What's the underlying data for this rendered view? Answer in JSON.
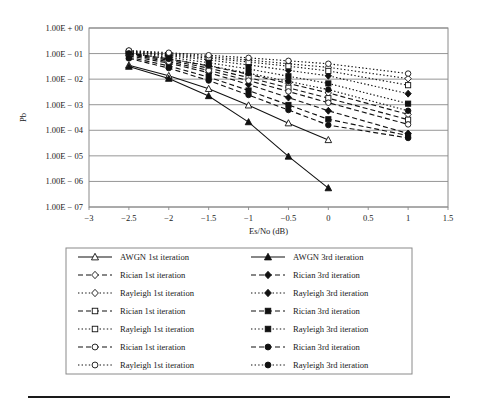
{
  "figure": {
    "background": "#ffffff",
    "ink_color": "#111111",
    "grid_color": "#8a8a8a",
    "has_bottom_rule": true
  },
  "chart_data": {
    "type": "line",
    "title": "",
    "xlabel": "Es/No (dB)",
    "ylabel": "Pb",
    "xlim": [
      -3,
      1.5
    ],
    "ylim": [
      1e-07,
      1
    ],
    "yscale": "log",
    "grid": true,
    "legend_position": "below-plot",
    "xticks": [
      -3,
      -2.5,
      -2,
      -1.5,
      -1,
      -0.5,
      0,
      0.5,
      1,
      1.5
    ],
    "xticklabels": [
      "−3",
      "−2.5",
      "−2",
      "−1.5",
      "−1",
      "−0.5",
      "0",
      "0.5",
      "1",
      "1.5"
    ],
    "yticks": [
      1,
      0.1,
      0.01,
      0.001,
      0.0001,
      1e-05,
      1e-06,
      1e-07
    ],
    "yticklabels": [
      "1.00E + 00",
      "1.00E − 01",
      "1.00E − 02",
      "1.00E − 03",
      "1.00E − 04",
      "1.00E − 05",
      "1.00E − 06",
      "1.00E − 07"
    ],
    "series": [
      {
        "name": "AWGN 1st iteration",
        "channel": "AWGN",
        "iteration": "1st",
        "dash": "solid",
        "marker": "triangle",
        "filled": false,
        "x": [
          -2.5,
          -2,
          -1.5,
          -1,
          -0.5,
          0
        ],
        "values": [
          0.035,
          0.0135,
          0.0042,
          0.00095,
          0.00019,
          4.2e-05
        ]
      },
      {
        "name": "AWGN 3rd iteration",
        "channel": "AWGN",
        "iteration": "3rd",
        "dash": "solid",
        "marker": "triangle",
        "filled": true,
        "x": [
          -2.5,
          -2,
          -1.5,
          -1,
          -0.5,
          0
        ],
        "values": [
          0.031,
          0.0105,
          0.0022,
          0.00021,
          9.5e-06,
          5.5e-07
        ]
      },
      {
        "name": "Rician 1st iteration",
        "channel": "Rician",
        "iteration": "1st",
        "dash": "dashed",
        "marker": "diamond",
        "filled": false,
        "x": [
          -2.5,
          -2,
          -1.5,
          -1,
          -0.5,
          0,
          1
        ],
        "values": [
          0.105,
          0.062,
          0.033,
          0.0155,
          0.0068,
          0.0029,
          0.00042
        ]
      },
      {
        "name": "Rician 3rd iteration",
        "channel": "Rician",
        "iteration": "3rd",
        "dash": "dashed",
        "marker": "diamond",
        "filled": true,
        "x": [
          -2.5,
          -2,
          -1.5,
          -1,
          -0.5,
          0,
          1
        ],
        "values": [
          0.082,
          0.042,
          0.018,
          0.0062,
          0.0019,
          0.00058,
          7.5e-05
        ]
      },
      {
        "name": "Rayleigh 1st iteration",
        "channel": "Rayleigh",
        "iteration": "1st",
        "dash": "dotted",
        "marker": "diamond",
        "filled": false,
        "x": [
          -2.5,
          -2,
          -1.5,
          -1,
          -0.5,
          0,
          1
        ],
        "values": [
          0.125,
          0.098,
          0.075,
          0.056,
          0.04,
          0.029,
          0.0105
        ]
      },
      {
        "name": "Rayleigh 3rd iteration",
        "channel": "Rayleigh",
        "iteration": "3rd",
        "dash": "dotted",
        "marker": "diamond",
        "filled": true,
        "x": [
          -2.5,
          -2,
          -1.5,
          -1,
          -0.5,
          0,
          1
        ],
        "values": [
          0.115,
          0.082,
          0.056,
          0.036,
          0.022,
          0.0135,
          0.0027
        ]
      },
      {
        "name": "Rician 1st iteration",
        "channel": "Rician",
        "iteration": "1st",
        "dash": "dashed",
        "marker": "square",
        "filled": false,
        "x": [
          -2.5,
          -2,
          -1.5,
          -1,
          -0.5,
          0,
          1
        ],
        "values": [
          0.098,
          0.055,
          0.027,
          0.0115,
          0.0046,
          0.0018,
          0.00026
        ]
      },
      {
        "name": "Rician 3rd iteration",
        "channel": "Rician",
        "iteration": "3rd",
        "dash": "dashed",
        "marker": "square",
        "filled": true,
        "x": [
          -2.5,
          -2,
          -1.5,
          -1,
          -0.5,
          0,
          1
        ],
        "values": [
          0.072,
          0.033,
          0.012,
          0.0036,
          0.00098,
          0.00027,
          6.2e-05
        ]
      },
      {
        "name": "Rayleigh 1st iteration",
        "channel": "Rayleigh",
        "iteration": "1st",
        "dash": "dotted",
        "marker": "square",
        "filled": false,
        "x": [
          -2.5,
          -2,
          -1.5,
          -1,
          -0.5,
          0,
          1
        ],
        "values": [
          0.118,
          0.089,
          0.066,
          0.047,
          0.032,
          0.021,
          0.0058
        ]
      },
      {
        "name": "Rayleigh 3rd iteration",
        "channel": "Rayleigh",
        "iteration": "3rd",
        "dash": "dotted",
        "marker": "square",
        "filled": true,
        "x": [
          -2.5,
          -2,
          -1.5,
          -1,
          -0.5,
          0,
          1
        ],
        "values": [
          0.108,
          0.072,
          0.044,
          0.025,
          0.013,
          0.0068,
          0.0011
        ]
      },
      {
        "name": "Rician 1st iteration",
        "channel": "Rician",
        "iteration": "1st",
        "dash": "dashed",
        "marker": "circle",
        "filled": false,
        "x": [
          -2.5,
          -2,
          -1.5,
          -1,
          -0.5,
          0,
          1
        ],
        "values": [
          0.092,
          0.048,
          0.022,
          0.0088,
          0.0033,
          0.0012,
          0.00017
        ]
      },
      {
        "name": "Rician 3rd iteration",
        "channel": "Rician",
        "iteration": "3rd",
        "dash": "dashed",
        "marker": "circle",
        "filled": true,
        "x": [
          -2.5,
          -2,
          -1.5,
          -1,
          -0.5,
          0,
          1
        ],
        "values": [
          0.065,
          0.027,
          0.0088,
          0.0024,
          0.00062,
          0.00016,
          5e-05
        ]
      },
      {
        "name": "Rayleigh 1st iteration",
        "channel": "Rayleigh",
        "iteration": "1st",
        "dash": "dotted",
        "marker": "circle",
        "filled": false,
        "x": [
          -2.5,
          -2,
          -1.5,
          -1,
          -0.5,
          0,
          1
        ],
        "values": [
          0.132,
          0.108,
          0.086,
          0.068,
          0.052,
          0.04,
          0.0165
        ]
      },
      {
        "name": "Rayleigh 3rd iteration",
        "channel": "Rayleigh",
        "iteration": "3rd",
        "dash": "dotted",
        "marker": "circle",
        "filled": true,
        "x": [
          -2.5,
          -2,
          -1.5,
          -1,
          -0.5,
          0,
          1
        ],
        "values": [
          0.102,
          0.062,
          0.034,
          0.017,
          0.0082,
          0.0039,
          0.00058
        ]
      }
    ]
  },
  "legend": {
    "rows": [
      {
        "left": "AWGN 1st iteration",
        "right": "AWGN 3rd iteration"
      },
      {
        "left": "Rician 1st iteration",
        "right": "Rician 3rd iteration"
      },
      {
        "left": "Rayleigh 1st iteration",
        "right": "Rayleigh 3rd iteration"
      },
      {
        "left": "Rician 1st iteration",
        "right": "Rician 3rd iteration"
      },
      {
        "left": "Rayleigh 1st iteration",
        "right": "Rayleigh 3rd iteration"
      },
      {
        "left": "Rician 1st iteration",
        "right": "Rician 3rd iteration"
      },
      {
        "left": "Rayleigh 1st iteration",
        "right": "Rayleigh 3rd iteration"
      }
    ],
    "row_styles": [
      {
        "dash": "solid",
        "marker": "triangle"
      },
      {
        "dash": "dashed",
        "marker": "diamond"
      },
      {
        "dash": "dotted",
        "marker": "diamond"
      },
      {
        "dash": "dashed",
        "marker": "square"
      },
      {
        "dash": "dotted",
        "marker": "square"
      },
      {
        "dash": "dashed",
        "marker": "circle"
      },
      {
        "dash": "dotted",
        "marker": "circle"
      }
    ]
  }
}
